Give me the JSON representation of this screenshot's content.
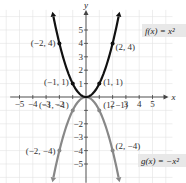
{
  "chart_data": {
    "type": "line",
    "title": "",
    "xlabel": "x",
    "ylabel": "y",
    "xlim": [
      -5,
      5
    ],
    "ylim": [
      -5,
      5
    ],
    "grid": true,
    "x_ticks": [
      -5,
      -4,
      -3,
      -2,
      2,
      3,
      4,
      5
    ],
    "x_tick_labels": [
      "−5",
      "−4",
      "−3",
      "−2",
      "2",
      "3",
      "4",
      "5"
    ],
    "y_ticks": [
      5,
      4,
      3,
      2,
      1,
      -2,
      -3,
      -4,
      -5
    ],
    "y_tick_labels": [
      "5",
      "4",
      "3",
      "2",
      "1",
      "−2",
      "−3",
      "−4",
      "−5"
    ],
    "series": [
      {
        "name": "f(x) = x²",
        "color": "#111111",
        "points": [
          [
            -2,
            4
          ],
          [
            -1,
            1
          ],
          [
            0,
            0
          ],
          [
            1,
            1
          ],
          [
            2,
            4
          ]
        ]
      },
      {
        "name": "g(x) = −x²",
        "color": "#888888",
        "points": [
          [
            -2,
            -4
          ],
          [
            -1,
            -1
          ],
          [
            0,
            0
          ],
          [
            1,
            -1
          ],
          [
            2,
            -4
          ]
        ]
      }
    ],
    "annotations": [
      {
        "text": "(−2, 4)",
        "x": -2,
        "y": 4
      },
      {
        "text": "(2, 4)",
        "x": 2,
        "y": 4
      },
      {
        "text": "(−1, 1)",
        "x": -1,
        "y": 1
      },
      {
        "text": "(1, 1)",
        "x": 1,
        "y": 1
      },
      {
        "text": "(−1, −1)",
        "x": -1,
        "y": -1
      },
      {
        "text": "(1, −1)",
        "x": 1,
        "y": -1
      },
      {
        "text": "(−2, −4)",
        "x": -2,
        "y": -4
      },
      {
        "text": "(2, −4)",
        "x": 2,
        "y": -4
      }
    ],
    "legend": [
      {
        "text": "f(x) = x²",
        "position": "upper-right"
      },
      {
        "text": "g(x) = −x²",
        "position": "lower-right"
      }
    ]
  }
}
